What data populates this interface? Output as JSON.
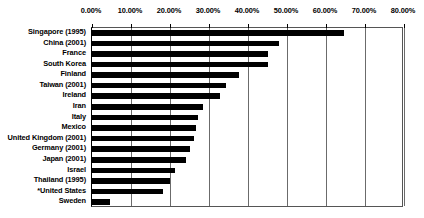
{
  "chart_data": {
    "type": "bar",
    "orientation": "horizontal",
    "title": "",
    "subtitle": "",
    "xlabel": "",
    "ylabel": "",
    "xlim": [
      0,
      0.8
    ],
    "xtick_labels": [
      "0.00%",
      "10.00%",
      "20.00%",
      "30.00%",
      "40.00%",
      "50.00%",
      "60.00%",
      "70.00%",
      "80.00%"
    ],
    "xtick_values": [
      0,
      0.1,
      0.2,
      0.3,
      0.4,
      0.5,
      0.6,
      0.7,
      0.8
    ],
    "grid": true,
    "legend": false,
    "bar_color": "#000000",
    "categories": [
      "Singapore (1995)",
      "China (2001)",
      "France",
      "South Korea",
      "Finland",
      "Taiwan (2001)",
      "Ireland",
      "Iran",
      "Italy",
      "Mexico",
      "United Kingdom (2001)",
      "Germany (2001)",
      "Japan (2001)",
      "Israel",
      "Thailand (1995)",
      "*United States",
      "Sweden"
    ],
    "values": [
      0.645,
      0.48,
      0.45,
      0.45,
      0.376,
      0.344,
      0.327,
      0.285,
      0.271,
      0.266,
      0.261,
      0.251,
      0.241,
      0.212,
      0.2,
      0.183,
      0.046
    ],
    "value_labels": [
      "64.50%",
      "48.00%",
      "45.00%",
      "45.00%",
      "37.60%",
      "34.40%",
      "32.70%",
      "28.50%",
      "27.10%",
      "26.60%",
      "26.10%",
      "25.10%",
      "24.10%",
      "21.20%",
      "20.00%",
      "18.30%",
      "4.60%"
    ]
  }
}
